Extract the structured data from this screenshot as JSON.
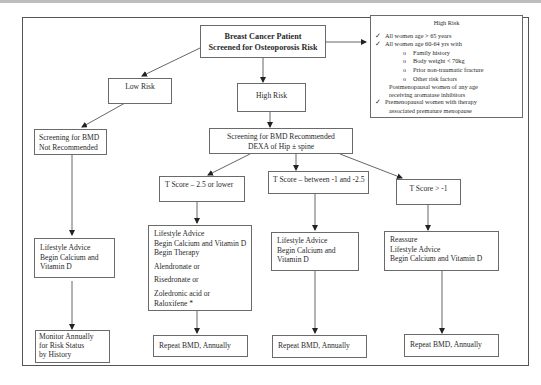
{
  "diagram": {
    "type": "flowchart",
    "title": "Breast Cancer Patient Screened for Osteoporosis Risk",
    "root": {
      "line1": "Breast Cancer Patient",
      "line2": "Screened for Osteoporosis Risk"
    },
    "high_risk_criteria": {
      "title": "High Risk",
      "items": [
        "All  women age > 65 years",
        "All  women age 60-64 yrs with"
      ],
      "subitems": [
        "Family history",
        "Body weight < 70kg",
        "Prior non-traumatic fracture",
        "Other risk factors"
      ],
      "postmenopausal_line1": "Postmenopausal women of any age",
      "postmenopausal_line2": "receiving aromatase inhibitors",
      "premenopausal_line1": "Premenopausal women with therapy",
      "premenopausal_line2": "associated premature menopause",
      "check_glyph": "✓",
      "bullet_glyph": "o"
    },
    "low_risk": {
      "label": "Low Risk",
      "screening_line1": "Screening for BMD",
      "screening_line2": "Not Recommended",
      "advice_line1": "Lifestyle Advice",
      "advice_line2": "Begin Calcium and",
      "advice_line3": "Vitamin D",
      "monitor_line1": "Monitor Annually",
      "monitor_line2": "for Risk Status",
      "monitor_line3": "by History"
    },
    "high_risk": {
      "label": "High Risk",
      "screening_line1": "Screening for BMD Recommended",
      "screening_line2": "DEXA of Hip ± spine"
    },
    "branches": [
      {
        "tscore": "T Score – 2.5 or lower",
        "lines": [
          "Lifestyle Advice",
          "Begin Calcium and Vitamin D",
          "Begin Therapy",
          "Alendronate or",
          "Risedronate or",
          "Zoledronic acid or",
          "Raloxifene *"
        ],
        "followup": "Repeat BMD, Annually"
      },
      {
        "tscore": "T Score – between -1 and -2.5",
        "lines": [
          "Lifestyle Advice",
          "Begin Calcium and",
          "Vitamin D"
        ],
        "followup": "Repeat BMD, Annually"
      },
      {
        "tscore": "T Score > -1",
        "lines": [
          "Reassure",
          "Lifestyle Advice",
          "Begin Calcium and Vitamin D"
        ],
        "followup": "Repeat BMD, Annually"
      }
    ]
  }
}
